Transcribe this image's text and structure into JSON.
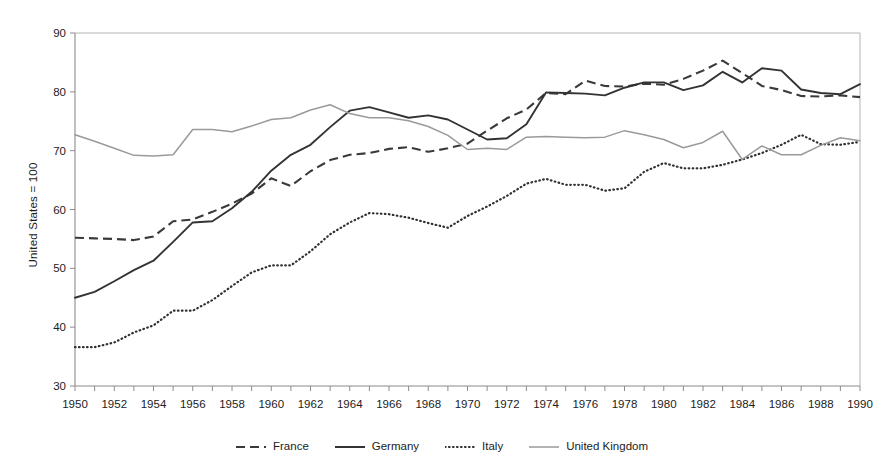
{
  "chart_data": {
    "type": "line",
    "title": "",
    "xlabel": "",
    "ylabel": "United States = 100",
    "xlim": [
      1950,
      1990
    ],
    "ylim": [
      30,
      90
    ],
    "grid": false,
    "legend_position": "bottom",
    "y_ticks": [
      30,
      40,
      50,
      60,
      70,
      80,
      90
    ],
    "x_ticks": [
      1950,
      1952,
      1954,
      1956,
      1958,
      1960,
      1962,
      1964,
      1966,
      1968,
      1970,
      1972,
      1974,
      1976,
      1978,
      1980,
      1982,
      1984,
      1986,
      1988,
      1990
    ],
    "x_minor_tick_step": 1,
    "x": [
      1950,
      1951,
      1952,
      1953,
      1954,
      1955,
      1956,
      1957,
      1958,
      1959,
      1960,
      1961,
      1962,
      1963,
      1964,
      1965,
      1966,
      1967,
      1968,
      1969,
      1970,
      1971,
      1972,
      1973,
      1974,
      1975,
      1976,
      1977,
      1978,
      1979,
      1980,
      1981,
      1982,
      1983,
      1984,
      1985,
      1986,
      1987,
      1988,
      1989,
      1990
    ],
    "series": [
      {
        "name": "France",
        "style": "dashed",
        "color": "#3a3a3a",
        "values": [
          55.2,
          55.1,
          55.0,
          54.8,
          55.4,
          58.0,
          58.3,
          59.6,
          61.0,
          62.7,
          65.3,
          64.0,
          66.5,
          68.4,
          69.3,
          69.6,
          70.3,
          70.6,
          69.8,
          70.4,
          71.2,
          73.4,
          75.5,
          77.0,
          79.8,
          79.6,
          81.9,
          81.0,
          80.9,
          81.4,
          81.2,
          82.2,
          83.6,
          85.3,
          83.2,
          81.0,
          80.3,
          79.3,
          79.2,
          79.4,
          79.1
        ]
      },
      {
        "name": "Germany",
        "style": "solid",
        "color": "#333333",
        "values": [
          45.0,
          46.0,
          47.8,
          49.7,
          51.3,
          54.5,
          57.8,
          58.0,
          60.2,
          63.0,
          66.6,
          69.3,
          71.0,
          74.0,
          76.8,
          77.4,
          76.5,
          75.6,
          76.0,
          75.3,
          73.6,
          71.9,
          72.1,
          74.5,
          79.9,
          79.8,
          79.7,
          79.4,
          80.7,
          81.6,
          81.6,
          80.3,
          81.1,
          83.4,
          81.6,
          84.0,
          83.6,
          80.4,
          79.8,
          79.6,
          81.3
        ]
      },
      {
        "name": "Italy",
        "style": "dotted",
        "color": "#303030",
        "values": [
          36.6,
          36.6,
          37.4,
          39.1,
          40.3,
          42.8,
          42.8,
          44.6,
          47.0,
          49.3,
          50.5,
          50.5,
          52.9,
          55.8,
          57.8,
          59.4,
          59.2,
          58.6,
          57.7,
          56.9,
          58.9,
          60.5,
          62.3,
          64.4,
          65.2,
          64.2,
          64.2,
          63.2,
          63.6,
          66.4,
          67.9,
          67.0,
          67.0,
          67.6,
          68.5,
          69.6,
          71.0,
          72.7,
          71.1,
          71.0,
          71.5
        ]
      },
      {
        "name": "United Kingdom",
        "style": "thin-solid",
        "color": "#9a9a9a",
        "values": [
          72.7,
          71.6,
          70.4,
          69.2,
          69.1,
          69.3,
          73.6,
          73.6,
          73.2,
          74.2,
          75.3,
          75.6,
          76.9,
          77.8,
          76.3,
          75.6,
          75.6,
          75.1,
          74.1,
          72.6,
          70.2,
          70.4,
          70.2,
          72.3,
          72.4,
          72.3,
          72.2,
          72.3,
          73.4,
          72.7,
          71.9,
          70.5,
          71.4,
          73.3,
          68.5,
          70.8,
          69.3,
          69.3,
          70.9,
          72.2,
          71.7
        ]
      }
    ]
  },
  "legend": {
    "items": [
      {
        "label": "France",
        "style": "dashed"
      },
      {
        "label": "Germany",
        "style": "solid"
      },
      {
        "label": "Italy",
        "style": "dotted"
      },
      {
        "label": "United Kingdom",
        "style": "thin-solid"
      }
    ]
  }
}
